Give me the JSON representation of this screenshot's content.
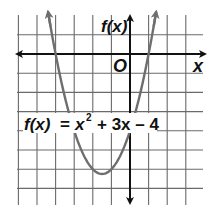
{
  "chart_data": {
    "type": "line",
    "title": "",
    "function": "f(x) = x^2 + 3x - 4",
    "equation_label": {
      "lhs": "f(x)",
      "eq": "=",
      "x_base": "x",
      "x_exp": "2",
      "rest": "+ 3x – 4"
    },
    "xlabel": "x",
    "ylabel": "f(x)",
    "origin_label": "O",
    "xlim": [
      -6,
      4
    ],
    "ylim": [
      -8,
      2
    ],
    "grid": true,
    "grid_step": 1,
    "series": [
      {
        "name": "f(x) = x^2 + 3x - 4",
        "x": [
          -4.4,
          -4,
          -3.5,
          -3,
          -2.5,
          -2,
          -1.5,
          -1,
          -0.5,
          0,
          0.5,
          1,
          1.4
        ],
        "y": [
          1.76,
          0,
          -2.25,
          -4,
          -5.25,
          -6,
          -6.25,
          -6,
          -5.25,
          -4,
          -2.25,
          0,
          1.76
        ]
      }
    ],
    "key_points": {
      "roots": [
        -4,
        1
      ],
      "vertex": [
        -1.5,
        -6.25
      ],
      "y_intercept": -4
    },
    "colors": {
      "curve": "#6e6e6e",
      "grid": "#6a6a6a",
      "axes": "#111111"
    }
  }
}
